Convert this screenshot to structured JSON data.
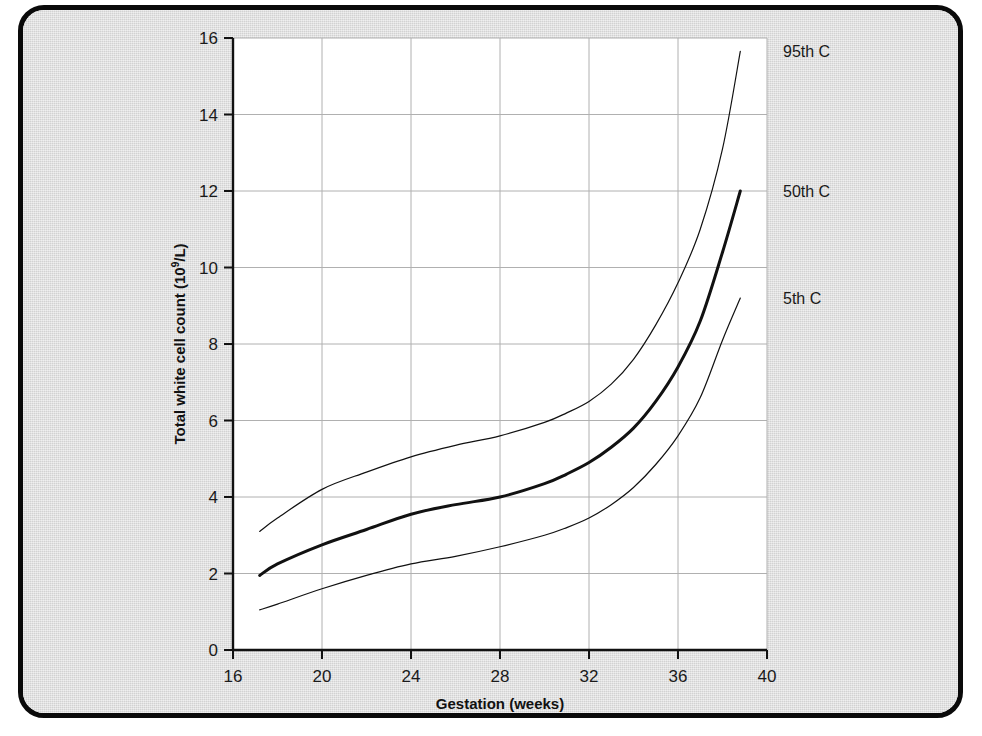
{
  "figure": {
    "background_color": "#dcdcdc",
    "frame_color": "#0a0a0a",
    "plot_background": "#ffffff"
  },
  "chart_data": {
    "type": "line",
    "title": "",
    "subtitle": "",
    "xlabel": "Gestation (weeks)",
    "ylabel": "Total white cell count (10⁹/L)",
    "ylabel_main": "Total white cell count (10",
    "ylabel_sup": "9",
    "ylabel_tail": "/L)",
    "xlim": [
      16,
      40
    ],
    "ylim": [
      0,
      16
    ],
    "xticks": [
      16,
      20,
      24,
      28,
      32,
      36,
      40
    ],
    "xtick_labels": [
      "16",
      "20",
      "24",
      "28",
      "32",
      "36",
      "40"
    ],
    "yticks": [
      0,
      2,
      4,
      6,
      8,
      10,
      12,
      14,
      16
    ],
    "ytick_labels": [
      "0",
      "2",
      "4",
      "6",
      "8",
      "10",
      "12",
      "14",
      "16"
    ],
    "grid": true,
    "grid_color": "#b0b0b0",
    "legend_position": "right-inline-annotations",
    "x": [
      17.2,
      18,
      20,
      22,
      24,
      26,
      28,
      30,
      31,
      32,
      33,
      34,
      35,
      36,
      37,
      38,
      38.8
    ],
    "series": [
      {
        "name": "95th C",
        "label": "95th C",
        "color": "#111111",
        "linewidth": 1.2,
        "label_y_value": 15.65,
        "values": [
          3.1,
          3.45,
          4.2,
          4.65,
          5.05,
          5.35,
          5.6,
          5.95,
          6.2,
          6.5,
          6.95,
          7.6,
          8.5,
          9.6,
          11.0,
          13.1,
          15.65
        ]
      },
      {
        "name": "50th C",
        "label": "50th C",
        "color": "#111111",
        "linewidth": 3.0,
        "label_y_value": 12.0,
        "values": [
          1.95,
          2.25,
          2.75,
          3.15,
          3.55,
          3.8,
          4.0,
          4.35,
          4.6,
          4.9,
          5.3,
          5.8,
          6.5,
          7.4,
          8.6,
          10.4,
          12.0
        ]
      },
      {
        "name": "5th C",
        "label": "5th C",
        "color": "#111111",
        "linewidth": 1.2,
        "label_y_value": 9.2,
        "values": [
          1.05,
          1.2,
          1.6,
          1.95,
          2.25,
          2.45,
          2.7,
          3.0,
          3.2,
          3.45,
          3.8,
          4.25,
          4.85,
          5.6,
          6.6,
          8.1,
          9.2
        ]
      }
    ]
  }
}
